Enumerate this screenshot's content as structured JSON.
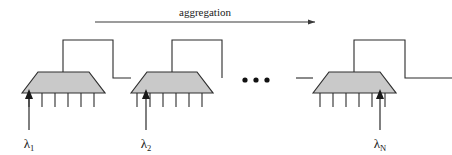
{
  "figure": {
    "type": "block-diagram",
    "background_color": "#ffffff",
    "stroke_color": "#2b2b2b",
    "unit_fill_color": "#c9c9c9",
    "width": 452,
    "height": 155
  },
  "aggregation": {
    "label": "aggregation",
    "label_x": 205,
    "label_y": 16,
    "arrow": {
      "x1": 95,
      "y1": 22,
      "x2": 315,
      "y2": 22,
      "direction": "right"
    }
  },
  "units": [
    {
      "id": "unit-1",
      "label": "λ1",
      "lambda_symbol": "λ",
      "lambda_subscript": "1",
      "base_left": 22,
      "base_right": 105,
      "top_left": 38,
      "top_right": 89,
      "top_y": 72,
      "base_y": 93,
      "riser_x": 63,
      "riser_top_y": 40,
      "tick_count": 6,
      "tick_length": 14,
      "arrow_tick_index": 0,
      "arrow_x": 29,
      "arrow_top_y": 92,
      "arrow_bottom_y": 130,
      "label_x": 29,
      "label_y": 148
    },
    {
      "id": "unit-2",
      "label": "λ2",
      "lambda_symbol": "λ",
      "lambda_subscript": "2",
      "base_left": 131,
      "base_right": 213,
      "top_left": 147,
      "top_right": 197,
      "top_y": 72,
      "base_y": 93,
      "riser_x": 172,
      "riser_top_y": 40,
      "tick_count": 6,
      "tick_length": 14,
      "arrow_tick_index": 1,
      "arrow_x": 146,
      "arrow_top_y": 92,
      "arrow_bottom_y": 130,
      "label_x": 146,
      "label_y": 148
    },
    {
      "id": "unit-n",
      "label": "λN",
      "lambda_symbol": "λ",
      "lambda_subscript": "N",
      "base_left": 313,
      "base_right": 396,
      "top_left": 329,
      "top_right": 380,
      "top_y": 72,
      "base_y": 93,
      "riser_x": 354,
      "riser_top_y": 40,
      "tick_count": 6,
      "tick_length": 14,
      "arrow_tick_index": 5,
      "arrow_x": 380,
      "arrow_top_y": 92,
      "arrow_bottom_y": 130,
      "label_x": 380,
      "label_y": 148
    }
  ],
  "connections": [
    {
      "id": "link-1-to-2",
      "from_unit": "unit-1",
      "to_unit": "unit-2",
      "path": "M63,72 L63,40 L113,40 L113,78 L131,78"
    },
    {
      "id": "link-2-outgoing",
      "from_unit": "unit-2",
      "to_unit": "ellipsis",
      "path": "M172,72 L172,40 L222,40 L222,78"
    },
    {
      "id": "link-into-n",
      "from_unit": "ellipsis",
      "to_unit": "unit-n",
      "path": "M296,78 L313,78"
    },
    {
      "id": "link-n-outgoing",
      "from_unit": "unit-n",
      "to_unit": "output",
      "path": "M354,72 L354,40 L405,40 L405,78 L452,78"
    }
  ],
  "ellipsis": {
    "label": "...",
    "dot_count": 3,
    "dots_x": [
      245,
      256,
      267
    ],
    "dots_y": 80,
    "dot_radius": 2.6
  }
}
